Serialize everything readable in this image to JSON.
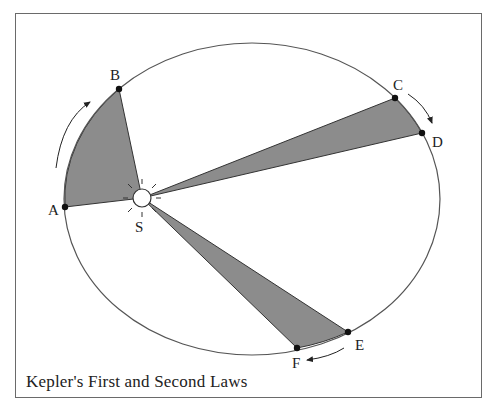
{
  "caption": "Kepler's First and Second Laws",
  "colors": {
    "orbit": "#555555",
    "sector_fill": "#8c8c8c",
    "sector_stroke": "#333333",
    "point": "#111111",
    "sun_fill": "#ffffff",
    "frame": "#6a6a6a"
  },
  "orbit": {
    "cx": 252,
    "cy": 199,
    "rx": 188,
    "ry": 156
  },
  "sun": {
    "label": "S",
    "x": 142,
    "y": 198,
    "r": 9
  },
  "points": [
    {
      "label": "A",
      "x": 65,
      "y": 207
    },
    {
      "label": "B",
      "x": 119,
      "y": 89
    },
    {
      "label": "C",
      "x": 395,
      "y": 98
    },
    {
      "label": "D",
      "x": 422,
      "y": 133
    },
    {
      "label": "E",
      "x": 348,
      "y": 332
    },
    {
      "label": "F",
      "x": 297,
      "y": 348
    }
  ],
  "sectors": [
    {
      "name": "sector-AB",
      "from": "A",
      "to": "B"
    },
    {
      "name": "sector-CD",
      "from": "C",
      "to": "D"
    },
    {
      "name": "sector-EF",
      "from": "E",
      "to": "F"
    }
  ],
  "arrows": [
    {
      "name": "motion-arrow-A-to-B",
      "direction": "counter-clockwise"
    },
    {
      "name": "motion-arrow-C-to-D",
      "direction": "clockwise"
    },
    {
      "name": "motion-arrow-E-to-F",
      "direction": "toward-F"
    }
  ]
}
